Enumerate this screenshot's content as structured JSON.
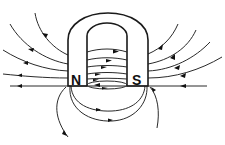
{
  "diagram": {
    "type": "horseshoe-magnet-field-lines",
    "magnet": {
      "north_label": "N",
      "south_label": "S"
    },
    "colors": {
      "line": "#2a2a2a",
      "background": "#ffffff"
    }
  }
}
